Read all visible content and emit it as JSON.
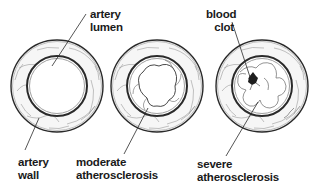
{
  "diagram": {
    "panels": [
      {
        "id": "normal",
        "labels": {
          "lumen": [
            "artery",
            "lumen"
          ],
          "wall": [
            "artery",
            "wall"
          ]
        }
      },
      {
        "id": "moderate",
        "labels": {
          "condition": [
            "moderate",
            "atherosclerosis"
          ]
        }
      },
      {
        "id": "severe",
        "labels": {
          "clot": [
            "blood",
            "clot"
          ],
          "condition": [
            "severe",
            "atherosclerosis"
          ]
        }
      }
    ],
    "colors": {
      "line": "#2a2a2a",
      "wall_fill": "#f4f4f4",
      "plaque_line": "#555555",
      "clot": "#222222",
      "background": "#ffffff"
    }
  }
}
